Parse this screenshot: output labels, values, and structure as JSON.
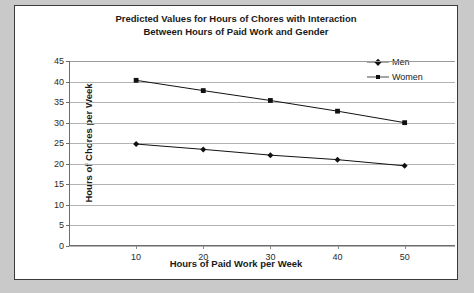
{
  "chart_data": {
    "type": "line",
    "title": "Predicted Values for Hours of Chores with Interaction Between Hours of Paid Work and Gender",
    "title_line1": "Predicted Values for Hours of Chores with Interaction",
    "title_line2": "Between Hours of Paid Work and Gender",
    "xlabel": "Hours of Paid Work per Week",
    "ylabel": "Hours of Chores per Week",
    "x": [
      10,
      20,
      30,
      40,
      50
    ],
    "xtick_labels": [
      "10",
      "20",
      "30",
      "40",
      "50"
    ],
    "ytick_labels": [
      "0",
      "5",
      "10",
      "15",
      "20",
      "25",
      "30",
      "35",
      "40",
      "45"
    ],
    "yticks": [
      0,
      5,
      10,
      15,
      20,
      25,
      30,
      35,
      40,
      45
    ],
    "ylim": [
      0,
      45
    ],
    "xlim": [
      0,
      57.5
    ],
    "grid": "horizontal",
    "legend_position": "top-right",
    "series": [
      {
        "name": "Men",
        "marker": "diamond",
        "color": "#111111",
        "values": [
          24.8,
          23.5,
          22.1,
          21.0,
          19.5
        ]
      },
      {
        "name": "Women",
        "marker": "square",
        "color": "#111111",
        "values": [
          40.3,
          37.8,
          35.4,
          32.8,
          30.0
        ]
      }
    ]
  },
  "legend": {
    "items": [
      {
        "label": "Men",
        "marker": "diamond"
      },
      {
        "label": "Women",
        "marker": "square"
      }
    ]
  },
  "colors": {
    "page_background": "#c9c9c9",
    "chart_background": "#ffffff",
    "border": "#3a3a3a",
    "gridline": "#b3b3b3",
    "axis": "#6e6e6e",
    "text": "#1a1a1a",
    "series": "#111111"
  }
}
